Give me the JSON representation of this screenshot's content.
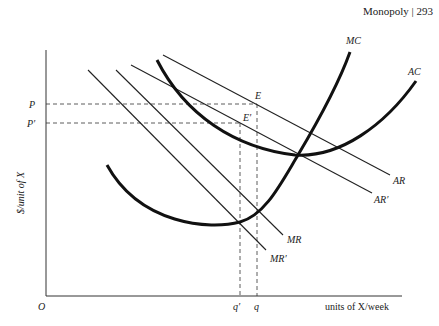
{
  "header": {
    "page_label": "Monopoly | 293"
  },
  "diagram": {
    "y_axis_label": "$/unit of X",
    "x_axis_label": "units of X/week",
    "origin_label": "O",
    "price_labels": [
      "P",
      "P′"
    ],
    "quantity_labels": [
      "q′",
      "q"
    ],
    "point_labels": [
      "E",
      "E′"
    ],
    "curves": {
      "MC": "MC",
      "AC": "AC",
      "AR": "AR",
      "AR_prime": "AR′",
      "MR": "MR",
      "MR_prime": "MR′"
    }
  }
}
